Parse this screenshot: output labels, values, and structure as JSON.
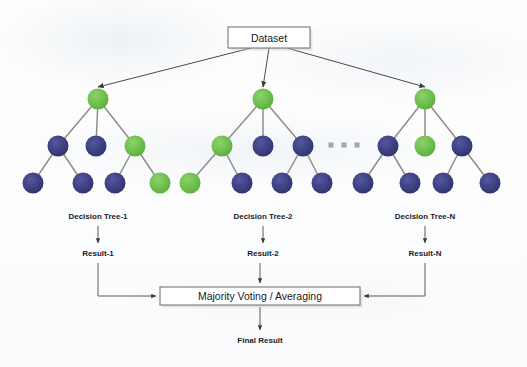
{
  "diagram": {
    "type": "flowchart",
    "colors": {
      "node_green": "#6cbf4b",
      "node_blue": "#3c3f82",
      "edge": "#8d8f86",
      "arrow": "#4a4a4a",
      "box_stroke": "#6a6a6a",
      "box_fill": "#ffffff",
      "text": "#17171f",
      "background": "#fdfdfd",
      "ellipsis": "#9aa6b4"
    },
    "boxes": {
      "dataset": {
        "label": "Dataset",
        "x": 228,
        "y": 27,
        "w": 82,
        "h": 21
      },
      "aggregate": {
        "label": "Majority Voting / Averaging",
        "x": 160,
        "y": 287,
        "w": 200,
        "h": 18
      }
    },
    "final_result": {
      "label": "Final Result",
      "x": 260,
      "y": 343
    },
    "ellipsis": {
      "count": 3,
      "x": [
        331,
        344,
        357
      ],
      "y": 145,
      "size": 5
    },
    "trees": [
      {
        "id": "tree-1",
        "label": "Decision Tree-1",
        "label_x": 98,
        "label_y": 219,
        "result": {
          "label": "Result-1",
          "x": 98,
          "y": 256
        },
        "root": {
          "x": 98,
          "y": 99,
          "color": "green"
        },
        "mid": [
          {
            "x": 58,
            "y": 146,
            "color": "blue"
          },
          {
            "x": 96,
            "y": 146,
            "color": "blue"
          },
          {
            "x": 135,
            "y": 146,
            "color": "green"
          }
        ],
        "leaves": [
          {
            "x": 33,
            "y": 183,
            "color": "blue",
            "parent": 0
          },
          {
            "x": 83,
            "y": 183,
            "color": "blue",
            "parent": 0
          },
          {
            "x": 115,
            "y": 183,
            "color": "blue",
            "parent": 2
          },
          {
            "x": 160,
            "y": 183,
            "color": "green",
            "parent": 2
          }
        ]
      },
      {
        "id": "tree-2",
        "label": "Decision Tree-2",
        "label_x": 263,
        "label_y": 219,
        "result": {
          "label": "Result-2",
          "x": 263,
          "y": 256
        },
        "root": {
          "x": 263,
          "y": 99,
          "color": "green"
        },
        "mid": [
          {
            "x": 222,
            "y": 146,
            "color": "green"
          },
          {
            "x": 263,
            "y": 146,
            "color": "blue"
          },
          {
            "x": 303,
            "y": 146,
            "color": "blue"
          }
        ],
        "leaves": [
          {
            "x": 190,
            "y": 183,
            "color": "green",
            "parent": 0
          },
          {
            "x": 242,
            "y": 183,
            "color": "blue",
            "parent": 0
          },
          {
            "x": 282,
            "y": 183,
            "color": "blue",
            "parent": 2
          },
          {
            "x": 322,
            "y": 183,
            "color": "blue",
            "parent": 2
          }
        ]
      },
      {
        "id": "tree-n",
        "label": "Decision Tree-N",
        "label_x": 425,
        "label_y": 219,
        "result": {
          "label": "Result-N",
          "x": 425,
          "y": 256
        },
        "root": {
          "x": 425,
          "y": 99,
          "color": "green"
        },
        "mid": [
          {
            "x": 388,
            "y": 146,
            "color": "blue"
          },
          {
            "x": 425,
            "y": 146,
            "color": "green"
          },
          {
            "x": 462,
            "y": 146,
            "color": "blue"
          }
        ],
        "leaves": [
          {
            "x": 363,
            "y": 183,
            "color": "blue",
            "parent": 0
          },
          {
            "x": 410,
            "y": 183,
            "color": "blue",
            "parent": 0
          },
          {
            "x": 443,
            "y": 183,
            "color": "blue",
            "parent": 2
          },
          {
            "x": 490,
            "y": 183,
            "color": "blue",
            "parent": 2
          }
        ]
      }
    ]
  }
}
